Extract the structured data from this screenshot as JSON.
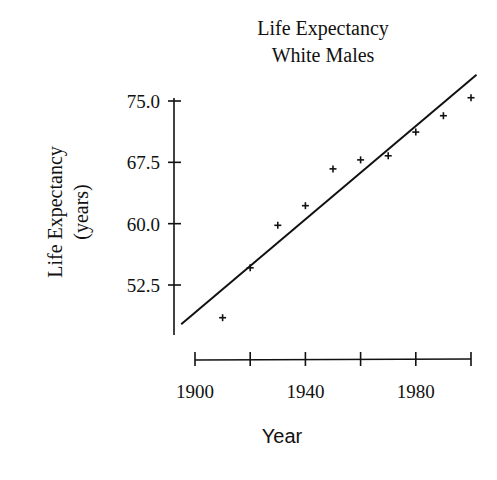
{
  "chart_data": {
    "type": "scatter",
    "title": "Life Expectancy",
    "subtitle": "White Males",
    "xlabel": "Year",
    "ylabel": "Life Expectancy",
    "ylabel_units": "(years)",
    "x": [
      1910,
      1920,
      1930,
      1940,
      1950,
      1960,
      1970,
      1980,
      1990,
      2000
    ],
    "series": [
      {
        "name": "Life Expectancy, White Males",
        "values": [
          48.5,
          54.6,
          59.8,
          62.2,
          66.7,
          67.8,
          68.3,
          71.2,
          73.2,
          75.4
        ],
        "marker": "+"
      }
    ],
    "trendline": {
      "type": "linear",
      "start": {
        "x": 1895,
        "y": 47.7
      },
      "end": {
        "x": 2002,
        "y": 78.2
      }
    },
    "xticks": [
      1900,
      1920,
      1940,
      1960,
      1980,
      2000
    ],
    "xtick_labels": [
      "1900",
      "",
      "1940",
      "",
      "1980",
      ""
    ],
    "yticks": [
      52.5,
      60.0,
      67.5,
      75.0
    ],
    "ytick_labels": [
      "52.5",
      "60.0",
      "67.5",
      "75.0"
    ],
    "xlim": [
      1900,
      2000
    ],
    "ylim": [
      46,
      75
    ],
    "grid": false,
    "legend": "none"
  }
}
